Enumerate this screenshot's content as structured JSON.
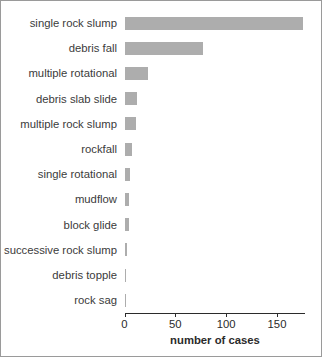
{
  "chart_data": {
    "type": "bar",
    "orientation": "horizontal",
    "title": "",
    "xlabel": "number of cases",
    "ylabel": "",
    "xlim": [
      0,
      178
    ],
    "grid": false,
    "legend": null,
    "bar_color": "#adadad",
    "axis_color": "#2b2b2b",
    "xticks": [
      0,
      50,
      100,
      150
    ],
    "xtick_labels": [
      "0",
      "50",
      "100",
      "150"
    ],
    "categories": [
      "single rock slump",
      "debris fall",
      "multiple rotational",
      "debris slab slide",
      "multiple rock slump",
      "rockfall",
      "single rotational",
      "mudflow",
      "block glide",
      "successive rock slump",
      "debris topple",
      "rock sag"
    ],
    "values": [
      176,
      77,
      23,
      12,
      11,
      7,
      5,
      4,
      4,
      2,
      1,
      1
    ]
  }
}
